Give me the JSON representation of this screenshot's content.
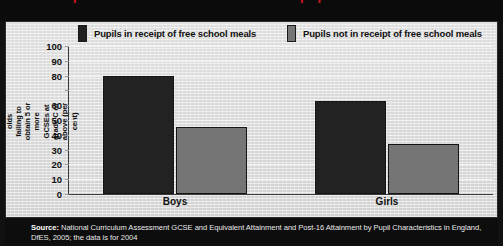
{
  "title": {
    "text": "This compares with less than half of other pupils."
  },
  "legend": {
    "items": [
      {
        "label": "Pupils in receipt of free school meals",
        "color": "#222222",
        "swatch": "dark"
      },
      {
        "label": "Pupils not in receipt of free school meals",
        "color": "#757575",
        "swatch": "grey"
      }
    ]
  },
  "yaxis": {
    "title": "Proportion of 16-year-olds failing to obtain 5 or more GCSEs at grade C or above (per cent)",
    "ticks": [
      "100",
      "90",
      "80",
      "",
      "60",
      "50",
      "40",
      "30",
      "20",
      "10",
      "0"
    ]
  },
  "categories": [
    "Boys",
    "Girls"
  ],
  "source": {
    "label": "Source:",
    "text": "National Curriculum Assessment GCSE and Equivalent Attainment and Post-16 Attainment by Pupil Characteristics in England, DfES, 2005; the data is for 2004"
  },
  "chart_data": {
    "type": "bar",
    "title": "This compares with less than half of other pupils.",
    "xlabel": "",
    "ylabel": "Proportion of 16-year-olds failing to obtain 5 or more GCSEs at grade C or above (per cent)",
    "categories": [
      "Boys",
      "Girls"
    ],
    "series": [
      {
        "name": "Pupils in receipt of free school meals",
        "color": "#222222",
        "values": [
          80,
          63
        ]
      },
      {
        "name": "Pupils not in receipt of free school meals",
        "color": "#757575",
        "values": [
          45,
          34
        ]
      }
    ],
    "ylim": [
      0,
      100
    ],
    "ytick_step": 10,
    "ytick_labels_shown": [
      "0",
      "10",
      "20",
      "30",
      "40",
      "50",
      "60",
      "80",
      "90",
      "100"
    ],
    "grid": true,
    "legend_position": "top",
    "note": "The 70 gridline label is not printed on the axis in the original figure."
  }
}
